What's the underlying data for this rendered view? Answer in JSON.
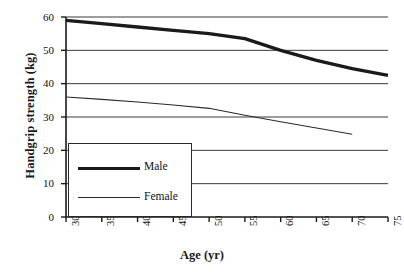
{
  "chart_data": {
    "type": "line",
    "title": "",
    "xlabel": "Age (yr)",
    "ylabel": "Handgrip strength (kg)",
    "xlim": [
      30,
      75
    ],
    "ylim": [
      0,
      60
    ],
    "xticks": [
      30,
      35,
      40,
      45,
      50,
      55,
      60,
      65,
      70,
      75
    ],
    "yticks": [
      0,
      10,
      20,
      30,
      40,
      50,
      60
    ],
    "grid": "horizontal",
    "legend_position": "lower left",
    "series": [
      {
        "name": "Male",
        "style": "thick",
        "color": "#1a1a1a",
        "x": [
          30,
          35,
          40,
          45,
          50,
          55,
          60,
          65,
          70,
          75
        ],
        "values": [
          59,
          58,
          57,
          56,
          55,
          53.5,
          50,
          47,
          44.5,
          42.5
        ]
      },
      {
        "name": "Female",
        "style": "thin",
        "color": "#2a2a2a",
        "x": [
          30,
          35,
          40,
          45,
          50,
          55,
          60,
          65,
          70
        ],
        "values": [
          36,
          35.3,
          34.5,
          33.6,
          32.6,
          30.5,
          28.6,
          26.7,
          24.8
        ]
      }
    ]
  },
  "legend": {
    "entries": [
      {
        "label": "Male"
      },
      {
        "label": "Female"
      }
    ]
  },
  "axes": {
    "x_title": "Age (yr)",
    "y_title": "Handgrip strength (kg)",
    "x_tick_labels": [
      "30",
      "35",
      "40",
      "45",
      "50",
      "55",
      "60",
      "65",
      "70",
      "75"
    ],
    "y_tick_labels": [
      "0",
      "10",
      "20",
      "30",
      "40",
      "50",
      "60"
    ]
  },
  "colors": {
    "axis": "#1a1a1a",
    "grid": "#3a3a3a",
    "male": "#1a1a1a",
    "female": "#2a2a2a",
    "background": "#ffffff"
  }
}
